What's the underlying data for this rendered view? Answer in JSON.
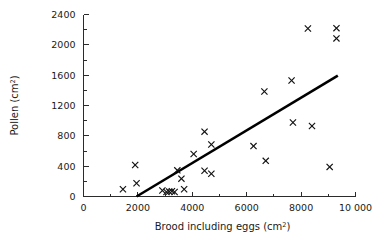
{
  "chart_data": {
    "type": "scatter",
    "title": "",
    "xlabel": "Brood including eggs  (cm2)",
    "xlabel_base": "Brood including eggs  (cm",
    "xlabel_sup": "2",
    "xlabel_close": ")",
    "ylabel": "Pollen  (cm2)",
    "ylabel_base": "Pollen  (cm",
    "ylabel_sup": "2",
    "ylabel_close": ")",
    "xlim": [
      0,
      10000
    ],
    "ylim": [
      0,
      2400
    ],
    "grid": false,
    "legend": null,
    "marker_style": "x",
    "marker_color": "#111111",
    "line_color": "#000000",
    "x_ticks": [
      0,
      2000,
      4000,
      6000,
      8000,
      10000
    ],
    "x_tick_labels": [
      "0",
      "2000",
      "4000",
      "6000",
      "8000",
      "10 000"
    ],
    "x_minor_ticks": [
      1000,
      3000,
      5000,
      7000,
      9000
    ],
    "y_ticks": [
      0,
      400,
      800,
      1200,
      1600,
      2000,
      2400
    ],
    "y_tick_labels": [
      "0",
      "400",
      "800",
      "1200",
      "1600",
      "2000",
      "2400"
    ],
    "y_minor_ticks": [
      200,
      600,
      1000,
      1400,
      1800,
      2200
    ],
    "points": [
      {
        "x": 1450,
        "y": 95
      },
      {
        "x": 1950,
        "y": 175
      },
      {
        "x": 1900,
        "y": 415
      },
      {
        "x": 2900,
        "y": 80
      },
      {
        "x": 3050,
        "y": 60
      },
      {
        "x": 3150,
        "y": 65
      },
      {
        "x": 3250,
        "y": 70
      },
      {
        "x": 3350,
        "y": 60
      },
      {
        "x": 3450,
        "y": 345
      },
      {
        "x": 3600,
        "y": 235
      },
      {
        "x": 3700,
        "y": 95
      },
      {
        "x": 4050,
        "y": 560
      },
      {
        "x": 4450,
        "y": 855
      },
      {
        "x": 4450,
        "y": 340
      },
      {
        "x": 4700,
        "y": 685
      },
      {
        "x": 4700,
        "y": 300
      },
      {
        "x": 6250,
        "y": 665
      },
      {
        "x": 6650,
        "y": 1385
      },
      {
        "x": 6700,
        "y": 470
      },
      {
        "x": 7650,
        "y": 1530
      },
      {
        "x": 7700,
        "y": 975
      },
      {
        "x": 8250,
        "y": 2215
      },
      {
        "x": 8400,
        "y": 930
      },
      {
        "x": 9050,
        "y": 390
      },
      {
        "x": 9300,
        "y": 2220
      },
      {
        "x": 9300,
        "y": 2085
      }
    ],
    "fit_line": {
      "x0": 1950,
      "y0": 0,
      "x1": 9350,
      "y1": 1595
    }
  }
}
